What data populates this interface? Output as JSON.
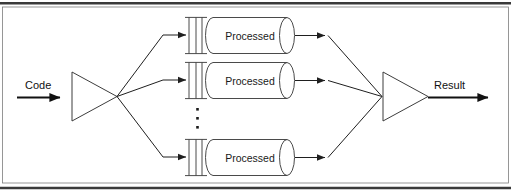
{
  "figure": {
    "background_color": "#ffffff",
    "line_color": "#2b2b2b",
    "frame_color": "#3a3a3a"
  },
  "input": {
    "label": "Code",
    "arrow_icon": "arrow-right-icon"
  },
  "output": {
    "label": "Result",
    "arrow_icon": "arrow-right-icon"
  },
  "fan_out": {
    "name": "fan-out-triangle",
    "shape": "triangle-pointing-right",
    "branch_count": 3
  },
  "fan_in": {
    "name": "fan-in-triangle",
    "shape": "triangle-pointing-right",
    "branch_count": 3
  },
  "ellipsis": {
    "glyph": "vertical-ellipsis",
    "dot_count": 3
  },
  "branches": [
    {
      "index": 1,
      "gate_icon": "gate-bars-icon",
      "gate_bar_count": 3,
      "node_shape": "cylinder",
      "node_label": "Processed",
      "in_arrow": "arrow-right-icon",
      "out_arrow": "arrow-right-icon"
    },
    {
      "index": 2,
      "gate_icon": "gate-bars-icon",
      "gate_bar_count": 3,
      "node_shape": "cylinder",
      "node_label": "Processed",
      "in_arrow": "arrow-right-icon",
      "out_arrow": "arrow-right-icon"
    },
    {
      "index": 3,
      "gate_icon": "gate-bars-icon",
      "gate_bar_count": 3,
      "node_shape": "cylinder",
      "node_label": "Processed",
      "in_arrow": "arrow-right-icon",
      "out_arrow": "arrow-right-icon"
    }
  ]
}
